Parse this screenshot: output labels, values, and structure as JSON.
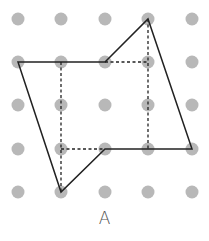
{
  "figure": {
    "label": "A",
    "grid": {
      "columns": [
        18,
        61,
        105,
        148,
        192
      ],
      "rows": [
        19,
        62,
        105,
        149,
        192
      ],
      "dot_radius": 6.5,
      "dot_color": "#b8b8b8"
    },
    "polygon": {
      "points": [
        [
          18,
          62
        ],
        [
          105,
          62
        ],
        [
          148,
          19
        ],
        [
          192,
          149
        ],
        [
          105,
          149
        ],
        [
          61,
          192
        ]
      ],
      "stroke": "#222222"
    },
    "dashed_lines": [
      [
        [
          61,
          62
        ],
        [
          61,
          192
        ]
      ],
      [
        [
          105,
          62
        ],
        [
          148,
          62
        ]
      ],
      [
        [
          148,
          19
        ],
        [
          148,
          149
        ]
      ],
      [
        [
          61,
          149
        ],
        [
          105,
          149
        ]
      ]
    ]
  }
}
